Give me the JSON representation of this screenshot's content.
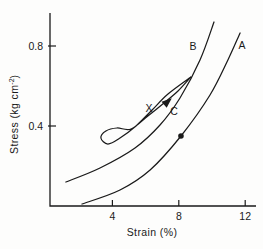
{
  "figure": {
    "background": "#fdfdfc",
    "ink_color": "#1a1a1a"
  },
  "chart_data": {
    "type": "line",
    "title": "",
    "xlabel": "Strain (%)",
    "ylabel": "Stress (kg cm⁻²)",
    "ylabel_main": "Stress (kg cm",
    "ylabel_sup": "-2",
    "ylabel_close": ")",
    "xlim": [
      0,
      12.6
    ],
    "ylim": [
      0,
      0.97
    ],
    "xticks": [
      4,
      8,
      12
    ],
    "yticks": [
      0.4,
      0.8
    ],
    "grid": false,
    "legend": "none",
    "series": [
      {
        "name": "A",
        "points": [
          [
            2.17,
            0.01
          ],
          [
            4.46,
            0.08
          ],
          [
            6.27,
            0.18
          ],
          [
            8.13,
            0.35
          ],
          [
            9.88,
            0.555
          ],
          [
            10.96,
            0.73
          ],
          [
            11.69,
            0.865
          ]
        ]
      },
      {
        "name": "B",
        "points": [
          [
            1.2,
            0.12
          ],
          [
            3.25,
            0.19
          ],
          [
            5.36,
            0.29
          ],
          [
            6.87,
            0.405
          ],
          [
            8.07,
            0.54
          ],
          [
            9.28,
            0.73
          ],
          [
            10.12,
            0.92
          ]
        ]
      }
    ],
    "hysteresis_loop": {
      "description": "slender unload-reload loop attached below curve B, pointed tip upper-right, rounded curl lower-left",
      "points": [
        [
          8.73,
          0.645
        ],
        [
          7.35,
          0.56
        ],
        [
          6.39,
          0.48
        ],
        [
          5.42,
          0.4
        ],
        [
          4.46,
          0.34
        ],
        [
          3.73,
          0.31
        ],
        [
          3.31,
          0.34
        ],
        [
          3.61,
          0.375
        ],
        [
          4.28,
          0.39
        ],
        [
          5.12,
          0.385
        ],
        [
          6.14,
          0.45
        ],
        [
          7.11,
          0.515
        ],
        [
          7.95,
          0.575
        ],
        [
          8.73,
          0.645
        ]
      ]
    },
    "marker_point": {
      "x": 8.13,
      "y": 0.35,
      "series": "A",
      "style": "filled-dot"
    },
    "arrow": {
      "x": 7.53,
      "y": 0.535,
      "angle_deg": -40,
      "label": "C"
    },
    "annotations": [
      {
        "text": "B",
        "x": 8.86,
        "y": 0.8
      },
      {
        "text": "A",
        "x": 11.81,
        "y": 0.805
      },
      {
        "text": "X",
        "x": 6.2,
        "y": 0.487
      },
      {
        "text": "C",
        "x": 7.71,
        "y": 0.475
      }
    ],
    "layout": {
      "ox": 46,
      "sx": 16.6,
      "oy": 206,
      "sy": 200,
      "axis_left": 50,
      "axis_bottom": 206,
      "axis_top": 13,
      "axis_right": 256,
      "tick_len": 6,
      "tick_font_px": 10.5,
      "annot_font_px": 10.5,
      "stroke_width": 1.25
    }
  }
}
